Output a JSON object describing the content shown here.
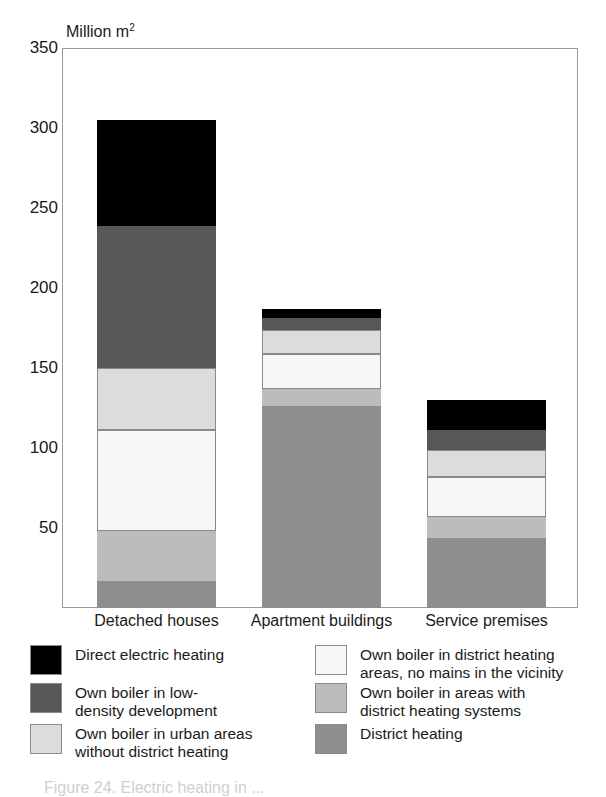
{
  "chart_data": {
    "type": "bar",
    "stacked": true,
    "title": "",
    "axis_title": "Million m",
    "axis_title_sup": "2",
    "xlabel": "",
    "ylabel": "Million m2",
    "ylim": [
      0,
      350
    ],
    "yticks": [
      350,
      300,
      250,
      200,
      150,
      100,
      50
    ],
    "grid": "horizontal-dashed",
    "legend_position": "below",
    "categories": [
      "Detached houses",
      "Apartment buildings",
      "Service premises"
    ],
    "series": [
      {
        "name": "Direct electric heating",
        "color": "#000000",
        "values": [
          66,
          6,
          19
        ]
      },
      {
        "name": "Own boiler in low-density development",
        "color": "#575757",
        "values": [
          89,
          7,
          12
        ]
      },
      {
        "name": "Own boiler in urban areas without district heating",
        "color": "#dcdcdc",
        "values": [
          39,
          15,
          17
        ]
      },
      {
        "name": "Own boiler in district heating areas, no mains in the vicinity",
        "color": "#f7f7f7",
        "values": [
          63,
          22,
          25
        ]
      },
      {
        "name": "Own boiler in areas with district heating systems",
        "color": "#bcbcbc",
        "values": [
          31,
          11,
          13
        ]
      },
      {
        "name": "District heating",
        "color": "#8e8e8e",
        "values": [
          17,
          126,
          44
        ]
      }
    ],
    "totals": [
      305,
      187,
      130
    ]
  },
  "axis": {
    "title_main": "Million m",
    "title_sup": "2",
    "ticks": [
      "350",
      "300",
      "250",
      "200",
      "150",
      "100",
      "50"
    ]
  },
  "xlabels": [
    "Detached houses",
    "Apartment buildings",
    "Service premises"
  ],
  "legend": {
    "left": [
      {
        "label": "Direct electric heating",
        "color": "#000000"
      },
      {
        "label": "Own boiler in low-\ndensity development",
        "color": "#575757"
      },
      {
        "label": "Own boiler in urban areas\nwithout district heating",
        "color": "#dcdcdc"
      }
    ],
    "right": [
      {
        "label": "Own boiler in district heating\nareas, no mains in the vicinity",
        "color": "#f7f7f7"
      },
      {
        "label": "Own boiler in areas with\ndistrict heating systems",
        "color": "#bcbcbc"
      },
      {
        "label": "District heating",
        "color": "#8e8e8e"
      }
    ]
  },
  "caption": "Figure 24. Electric heating in ..."
}
